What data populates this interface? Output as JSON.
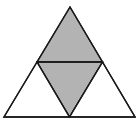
{
  "figure": {
    "width": 136,
    "height": 126,
    "colors": {
      "background": "#ffffff",
      "stroke": "#1a1a1a",
      "shaded_fill": "#b3b3b3",
      "unshaded_fill": "#ffffff"
    },
    "stroke_width": 1.4,
    "vertices": {
      "apex": [
        70,
        7
      ],
      "bottom_left": [
        4,
        117
      ],
      "bottom_right": [
        135,
        117
      ],
      "mid_left": [
        37,
        62
      ],
      "mid_right": [
        102.5,
        62
      ],
      "mid_bottom": [
        69.5,
        117
      ]
    },
    "sub_triangles": [
      {
        "name": "top",
        "shaded": true
      },
      {
        "name": "center",
        "shaded": true
      },
      {
        "name": "bottom-left",
        "shaded": false
      },
      {
        "name": "bottom-right",
        "shaded": false
      }
    ]
  }
}
